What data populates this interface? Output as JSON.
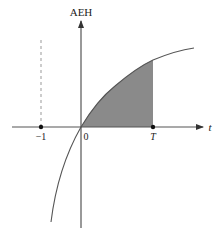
{
  "diagram": {
    "y_axis_label": "AEH",
    "x_axis_label": "t",
    "tick_labels": {
      "neg_one": "−1",
      "zero": "0",
      "T": "T"
    },
    "colors": {
      "axis": "#555555",
      "curve": "#555555",
      "shade": "#8a8a8a",
      "dashed": "#999999"
    },
    "shaded_region": "area under curve from 0 to T",
    "asymptote": "vertical dashed line at t = −1"
  }
}
